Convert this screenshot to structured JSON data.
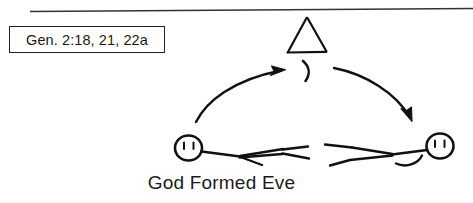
{
  "page": {
    "width": 473,
    "height": 203,
    "background_color": "#ffffff",
    "ink_color": "#111111",
    "style": "hand-drawn line art"
  },
  "divider": {
    "name": "horizontal-rule",
    "x1": 30,
    "y1": 11,
    "x2": 473,
    "y2": 8,
    "color": "#333333"
  },
  "reference_box": {
    "label": "Gen. 2:18, 21, 22a",
    "border_color": "#222222",
    "background_color": "#ffffff"
  },
  "caption": {
    "text": "God Formed Eve",
    "color": "#1a1a1a"
  },
  "illustration": {
    "title": "God Formed Eve",
    "symbols": [
      {
        "name": "triangle-symbol",
        "meaning": "divine presence triangle",
        "apex_x": 307,
        "apex_y": 18,
        "base_left_x": 287,
        "base_right_x": 326,
        "base_y": 52
      },
      {
        "name": "crescent-mark",
        "glyph": ")",
        "x": 303,
        "y": 70
      }
    ],
    "arrows": [
      {
        "name": "arrow-left-upward",
        "direction": "up-right",
        "from_x": 196,
        "from_y": 122,
        "to_x": 282,
        "to_y": 72
      },
      {
        "name": "arrow-right-downward",
        "direction": "down-right",
        "from_x": 334,
        "from_y": 70,
        "to_x": 412,
        "to_y": 122
      }
    ],
    "figures": [
      {
        "name": "figure-adam",
        "label": "Adam",
        "pose": "reclining, head at left",
        "head_cx": 188,
        "head_cy": 148,
        "head_r": 13,
        "eyes": 2
      },
      {
        "name": "figure-eve",
        "label": "Eve",
        "pose": "reclining, head at right",
        "head_cx": 440,
        "head_cy": 146,
        "head_r": 13,
        "eyes": 2
      }
    ]
  }
}
